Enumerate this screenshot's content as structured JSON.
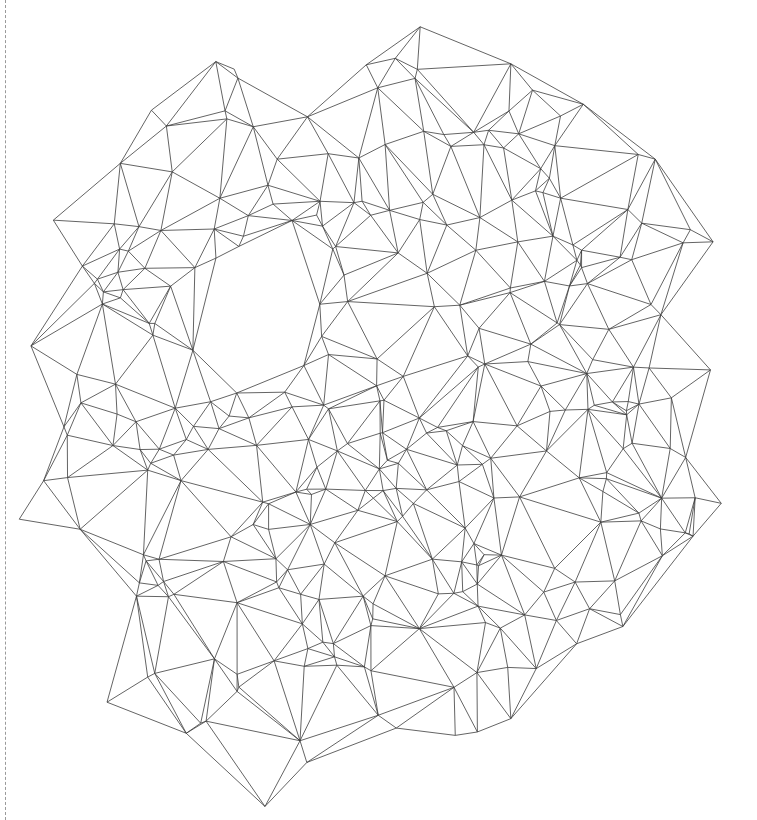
{
  "figure": {
    "title": "",
    "background_color": "#ffffff",
    "width": 757,
    "height": 820
  },
  "crop_marker": {
    "orientation": "vertical",
    "x": 5,
    "style": "dashed",
    "color": "#9a9a9a",
    "dash_length": 4,
    "gap_length": 4
  },
  "chart_data": {
    "type": "scatter",
    "render": "delaunay-triangulation-wireframe",
    "title": "",
    "subtitle": "",
    "xlabel": "",
    "ylabel": "",
    "grid": false,
    "legend": null,
    "axes_visible": false,
    "tick_labels": [],
    "annotations": [],
    "stroke_color": "#3c3c3c",
    "stroke_width": 0.8,
    "fill": "none",
    "xlim": [
      38,
      716
    ],
    "ylim": [
      62,
      763
    ],
    "point_count": 300,
    "generator": {
      "kind": "radial-jittered-cloud",
      "seed": 20240517,
      "center_x": 378,
      "center_y": 412,
      "radius_x": 338,
      "radius_y": 350,
      "rings": 11,
      "spike_count": 26,
      "spike_amplitude": 0.14,
      "jitter": 0.085
    }
  }
}
